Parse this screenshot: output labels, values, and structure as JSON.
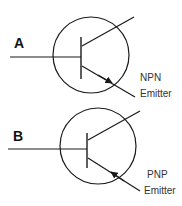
{
  "diagram": {
    "colors": {
      "stroke": "#1a1a1a",
      "text": "#333333",
      "background": "#ffffff"
    },
    "transistors": [
      {
        "id": "A",
        "label": "A",
        "type": "NPN",
        "caption_line1": "NPN",
        "caption_line2": "Emitter",
        "arrow_direction": "outward"
      },
      {
        "id": "B",
        "label": "B",
        "type": "PNP",
        "caption_line1": "PNP",
        "caption_line2": "Emitter",
        "arrow_direction": "inward"
      }
    ]
  }
}
